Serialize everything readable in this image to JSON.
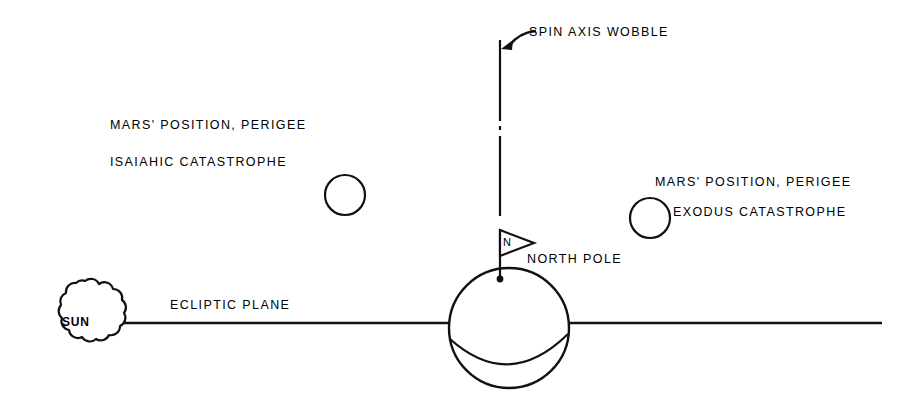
{
  "diagram": {
    "background_color": "#ffffff",
    "ink_color": "#000000",
    "labels": {
      "spin_axis_wobble": "SPIN AXIS WOBBLE",
      "mars_position_perigee_left": "MARS' POSITION, PERIGEE",
      "isaiahic_catastrophe": "ISAIAHIC CATASTROPHE",
      "mars_position_perigee_right": "MARS' POSITION, PERIGEE",
      "exodus_catastrophe": "EXODUS CATASTROPHE",
      "north_pole": "NORTH POLE",
      "ecliptic_plane": "ECLIPTIC PLANE",
      "sun": "SUN",
      "flag_letter": "N"
    },
    "objects": [
      {
        "name": "sun",
        "shape": "scalloped-cloud",
        "label": "SUN",
        "center": [
          85,
          322
        ],
        "radius": 42
      },
      {
        "name": "earth-globe",
        "shape": "circle-with-equator",
        "center": [
          509,
          328
        ],
        "radius": 60
      },
      {
        "name": "mars-circle-isaiahic",
        "shape": "circle",
        "center": [
          345,
          195
        ],
        "radius": 20
      },
      {
        "name": "mars-circle-exodus",
        "shape": "circle",
        "center": [
          650,
          218
        ],
        "radius": 20
      },
      {
        "name": "spin-axis-line",
        "shape": "broken-vertical-line",
        "x": 500,
        "y_top": 40,
        "y_bottom": 218,
        "gap": [
          122,
          133
        ]
      },
      {
        "name": "ecliptic-plane-line",
        "shape": "horizontal-line",
        "y": 323,
        "x_start": 113,
        "x_end": 882
      },
      {
        "name": "wobble-arrow",
        "shape": "curved-arrow",
        "points_to": "spin-axis-line"
      },
      {
        "name": "north-pole-flag",
        "shape": "triangular-flag",
        "letter": "N",
        "pole_x": 500,
        "pole_top": 230,
        "pole_bottom": 279
      }
    ]
  }
}
